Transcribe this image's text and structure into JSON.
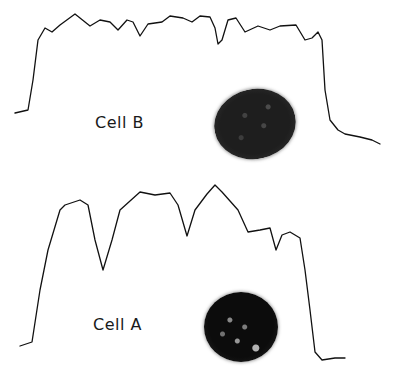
{
  "figure": {
    "panels": [
      {
        "id": "cell-b",
        "label": "Cell B",
        "trace_color": "#111111"
      },
      {
        "id": "cell-a",
        "label": "Cell A",
        "trace_color": "#111111"
      }
    ]
  },
  "chart_data": [
    {
      "type": "line",
      "title": "Cell B",
      "xlabel": "",
      "ylabel": "",
      "grid": false,
      "note": "Densitometric scan trace (pixel coordinates, y increases downward)",
      "points": [
        [
          15,
          113
        ],
        [
          28,
          110
        ],
        [
          33,
          80
        ],
        [
          38,
          40
        ],
        [
          45,
          28
        ],
        [
          52,
          32
        ],
        [
          60,
          25
        ],
        [
          75,
          14
        ],
        [
          90,
          26
        ],
        [
          100,
          20
        ],
        [
          110,
          22
        ],
        [
          118,
          30
        ],
        [
          127,
          20
        ],
        [
          133,
          22
        ],
        [
          140,
          36
        ],
        [
          148,
          24
        ],
        [
          162,
          22
        ],
        [
          170,
          16
        ],
        [
          183,
          18
        ],
        [
          192,
          22
        ],
        [
          200,
          16
        ],
        [
          210,
          17
        ],
        [
          215,
          28
        ],
        [
          218,
          44
        ],
        [
          222,
          40
        ],
        [
          228,
          20
        ],
        [
          236,
          18
        ],
        [
          245,
          32
        ],
        [
          258,
          26
        ],
        [
          270,
          30
        ],
        [
          280,
          26
        ],
        [
          296,
          25
        ],
        [
          305,
          40
        ],
        [
          312,
          38
        ],
        [
          318,
          32
        ],
        [
          322,
          40
        ],
        [
          325,
          90
        ],
        [
          330,
          120
        ],
        [
          338,
          130
        ],
        [
          345,
          134
        ],
        [
          360,
          137
        ],
        [
          372,
          140
        ],
        [
          380,
          144
        ]
      ]
    },
    {
      "type": "line",
      "title": "Cell A",
      "xlabel": "",
      "ylabel": "",
      "grid": false,
      "note": "Densitometric scan trace (pixel coordinates, y increases downward)",
      "points": [
        [
          20,
          346
        ],
        [
          32,
          342
        ],
        [
          40,
          290
        ],
        [
          48,
          250
        ],
        [
          60,
          210
        ],
        [
          65,
          205
        ],
        [
          80,
          200
        ],
        [
          88,
          205
        ],
        [
          95,
          240
        ],
        [
          103,
          270
        ],
        [
          112,
          240
        ],
        [
          120,
          210
        ],
        [
          140,
          192
        ],
        [
          155,
          195
        ],
        [
          170,
          193
        ],
        [
          178,
          205
        ],
        [
          187,
          236
        ],
        [
          195,
          210
        ],
        [
          207,
          194
        ],
        [
          215,
          185
        ],
        [
          222,
          192
        ],
        [
          238,
          210
        ],
        [
          248,
          232
        ],
        [
          260,
          230
        ],
        [
          270,
          228
        ],
        [
          276,
          250
        ],
        [
          282,
          235
        ],
        [
          290,
          232
        ],
        [
          300,
          238
        ],
        [
          305,
          270
        ],
        [
          310,
          310
        ],
        [
          315,
          352
        ],
        [
          322,
          360
        ],
        [
          335,
          358
        ],
        [
          345,
          358
        ]
      ]
    }
  ]
}
